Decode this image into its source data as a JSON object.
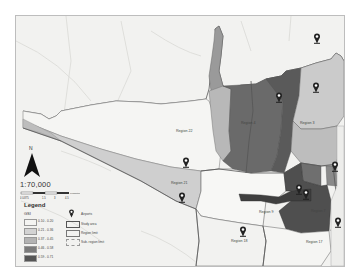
{
  "map": {
    "scale_text": "1:70,000",
    "north_label": "N",
    "scalebar": {
      "ticks": [
        "0 0.875",
        "1.5",
        "3",
        "4.5"
      ],
      "unit": "Kilometers"
    },
    "legend": {
      "title": "Legend",
      "gsi_label": "GSI",
      "classes": [
        {
          "range": "0.10 - 0.20",
          "color": "#f4f4f2"
        },
        {
          "range": "0.21 - 0.36",
          "color": "#d3d3d3"
        },
        {
          "range": "0.37 - 0.45",
          "color": "#b3b3b3"
        },
        {
          "range": "0.46 - 0.58",
          "color": "#7b7b7b"
        },
        {
          "range": "0.59 - 0.71",
          "color": "#555555"
        }
      ],
      "symbols": [
        {
          "label": "Airports",
          "icon": "airport-pin-icon"
        },
        {
          "label": "Study area",
          "icon": "study-area-outline"
        },
        {
          "label": "Region limit",
          "icon": "region-limit-outline"
        },
        {
          "label": "Sub- region limit",
          "icon": "subregion-limit-outline"
        }
      ]
    },
    "regions": [
      {
        "label": "Region 22",
        "x": 175,
        "y": 130
      },
      {
        "label": "Region 4",
        "x": 240,
        "y": 122
      },
      {
        "label": "Region 3",
        "x": 299,
        "y": 122
      },
      {
        "label": "Region 21",
        "x": 170,
        "y": 182
      },
      {
        "label": "Region 9",
        "x": 258,
        "y": 211
      },
      {
        "label": "Region 7",
        "x": 310,
        "y": 210
      },
      {
        "label": "Region 18",
        "x": 230,
        "y": 240
      },
      {
        "label": "Region 17",
        "x": 305,
        "y": 241
      }
    ],
    "airports": [
      {
        "x": 316,
        "y": 37
      },
      {
        "x": 278,
        "y": 96
      },
      {
        "x": 315,
        "y": 86
      },
      {
        "x": 185,
        "y": 161
      },
      {
        "x": 181,
        "y": 196
      },
      {
        "x": 334,
        "y": 165
      },
      {
        "x": 298,
        "y": 188
      },
      {
        "x": 305,
        "y": 193
      },
      {
        "x": 337,
        "y": 221
      },
      {
        "x": 242,
        "y": 230
      }
    ]
  }
}
